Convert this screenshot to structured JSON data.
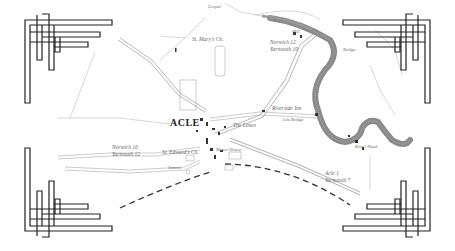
{
  "map": {
    "town_name": "ACLE",
    "labels": {
      "st_marys": "St. Mary's Ch.",
      "st_edwards": "St. Edward's Ch.",
      "the_limes": "The Limes",
      "riverside_inn": "Riverside Inn",
      "acle_bridge": "Acle Bridge",
      "bridge": "Bridge",
      "station": "Station",
      "norwich_12": "Norwich 12",
      "yarmouth_10": "Yarmouth 10",
      "norwich_10": "Norwich 10",
      "yarmouth_12": "Yarmouth 12",
      "acle_1": "Acle 1",
      "yarmouth_7": "Yarmouth 7",
      "manor_house": "Manor House",
      "mill": "Mill",
      "gospel": "Gospel",
      "marsh": "Marsh",
      "kings_head": "King's Head"
    },
    "colors": {
      "river": "#8a8a8a",
      "road": "#999999",
      "railway": "#333333",
      "ornament": "#222222",
      "text": "#666666"
    }
  }
}
